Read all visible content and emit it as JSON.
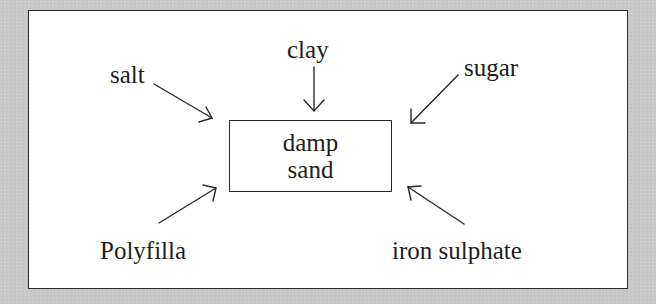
{
  "diagram": {
    "center": {
      "lines": [
        "damp",
        "sand"
      ]
    },
    "inputs": [
      {
        "id": "salt",
        "label": "salt",
        "position": "top-left"
      },
      {
        "id": "clay",
        "label": "clay",
        "position": "top"
      },
      {
        "id": "sugar",
        "label": "sugar",
        "position": "top-right"
      },
      {
        "id": "polyfilla",
        "label": "Polyfilla",
        "position": "bottom-left"
      },
      {
        "id": "iron-sulphate",
        "label": "iron sulphate",
        "position": "bottom-right"
      }
    ],
    "colors": {
      "background": "#c9c9c9",
      "panel": "#ffffff",
      "ink": "#1e1e1e"
    }
  }
}
